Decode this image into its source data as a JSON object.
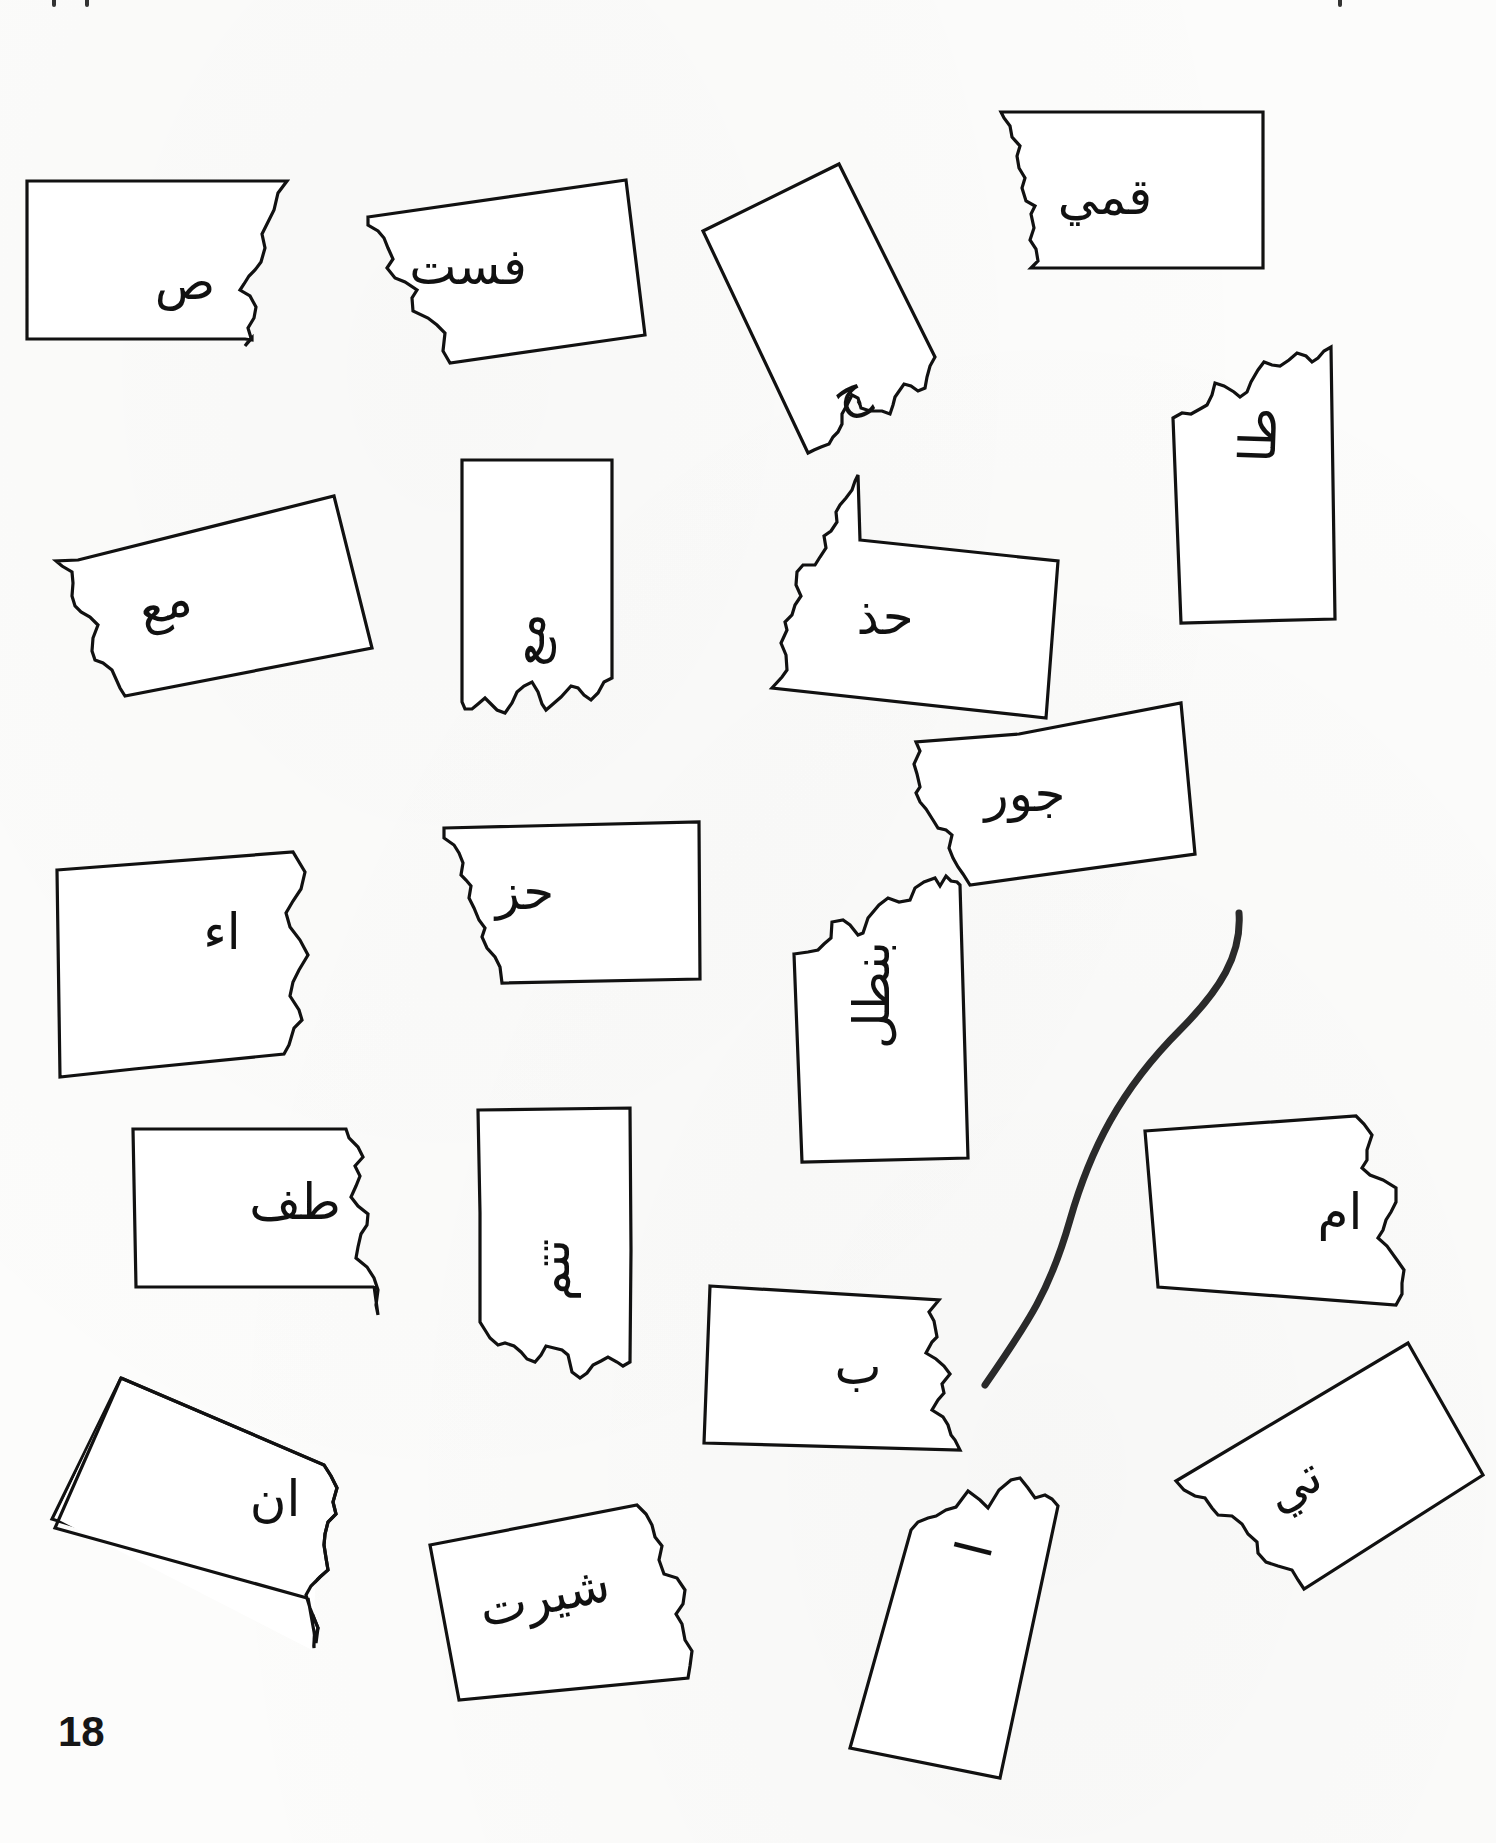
{
  "page": {
    "page_number": "18",
    "background_color": "#fcfcfb",
    "ink_color": "#111111"
  },
  "pieces": [
    {
      "id": "p1",
      "text": "ص",
      "side": "left-part",
      "rotation": 0
    },
    {
      "id": "p2",
      "text": "فست",
      "side": "right-part",
      "rotation": -9
    },
    {
      "id": "p3",
      "text": "ج",
      "side": "right-part",
      "rotation": -28
    },
    {
      "id": "p4",
      "text": "قمي",
      "side": "right-part",
      "rotation": 0
    },
    {
      "id": "p5",
      "text": "طا",
      "side": "right-part",
      "rotation": -88
    },
    {
      "id": "p6",
      "text": "مع",
      "side": "right-part",
      "rotation": -17
    },
    {
      "id": "p7",
      "text": "مع",
      "side": "left-part",
      "rotation": -90
    },
    {
      "id": "p8",
      "text": "حذ",
      "side": "right-part",
      "rotation": 8
    },
    {
      "id": "p9",
      "text": "جور",
      "side": "right-part",
      "rotation": -10
    },
    {
      "id": "p10",
      "text": "اء",
      "side": "left-part",
      "rotation": -7
    },
    {
      "id": "p11",
      "text": "حز",
      "side": "right-part",
      "rotation": 0
    },
    {
      "id": "p12",
      "text": "بنطل",
      "side": "right-part",
      "rotation": -90
    },
    {
      "id": "p13",
      "text": "طف",
      "side": "left-part",
      "rotation": 0
    },
    {
      "id": "p14",
      "text": "تتم",
      "side": "right-part",
      "rotation": -90
    },
    {
      "id": "p15",
      "text": "ام",
      "side": "left-part",
      "rotation": -4
    },
    {
      "id": "p16",
      "text": "ب",
      "side": "left-part",
      "rotation": 4
    },
    {
      "id": "p17",
      "text": "ان",
      "side": "left-part",
      "rotation": 26
    },
    {
      "id": "p18",
      "text": "تي",
      "side": "right-part",
      "rotation": -30
    },
    {
      "id": "p19",
      "text": "شيرت",
      "side": "right-part",
      "rotation": -14
    },
    {
      "id": "p20",
      "text": "ا",
      "side": "left-part",
      "rotation": -76
    }
  ],
  "connector": {
    "description": "hand-drawn matching line",
    "from_piece": "p9",
    "to_piece": "p16"
  }
}
